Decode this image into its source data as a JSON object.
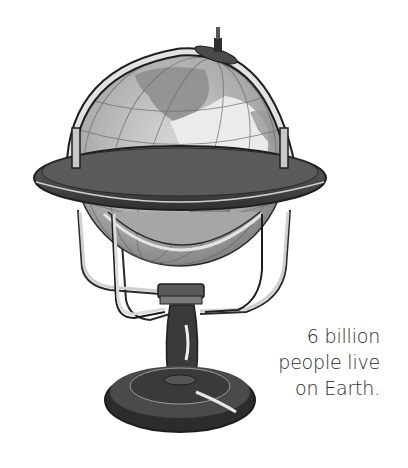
{
  "illustration": {
    "subject": "antique-desk-globe",
    "colors": {
      "background": "#ffffff",
      "ocean": "#b9b9b9",
      "land": "#e6e6e6",
      "land_dark": "#8a8a8a",
      "wood_dark": "#3c3c3c",
      "wood_mid": "#5e5e5e",
      "metal": "#d8d8d8",
      "outline": "#1e1e1e"
    }
  },
  "caption": {
    "lines": [
      "6 billion",
      "people live",
      "on Earth."
    ],
    "color": "#2a2a2a"
  }
}
